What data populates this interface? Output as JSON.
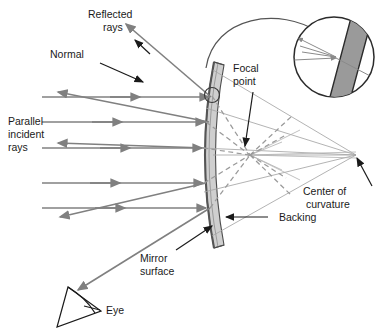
{
  "figure": {
    "background_color": "#ffffff",
    "width": 388,
    "height": 333
  },
  "colors": {
    "ray_gray": "#808080",
    "thin_gray": "#9a9a9a",
    "dashed_gray": "#9a9a9a",
    "mirror_outline": "#4d4d4d",
    "backing_fill": "#c8c8c8",
    "leader_black": "#1a1a1a",
    "text": "#1a1a1a",
    "magnifier_bar": "#8c8c8c"
  },
  "labels": {
    "reflected_rays": {
      "line1": "Reflected",
      "line2": "rays"
    },
    "normal": {
      "line1": "Normal"
    },
    "parallel_incident_rays": {
      "line1": "Parallel",
      "line2": "incident",
      "line3": "rays"
    },
    "focal_point": {
      "line1": "Focal",
      "line2": "point"
    },
    "center_of_curvature": {
      "line1": "Center of",
      "line2": "curvature"
    },
    "backing": {
      "line1": "Backing"
    },
    "mirror_surface": {
      "line1": "Mirror",
      "line2": "surface"
    },
    "eye": {
      "line1": "Eye"
    }
  },
  "optics_data": {
    "type": "ray-diagram",
    "element": "concave spherical mirror",
    "focal_point": {
      "x": 250,
      "y": 155
    },
    "center_of_curvature": {
      "x": 356,
      "y": 155
    },
    "mirror_vertex": {
      "x": 213,
      "y": 155
    },
    "incidence_marker": {
      "x": 212,
      "y": 95,
      "kind": "reflection-point-circle"
    },
    "incident_rays": [
      {
        "y": 97,
        "x_start": 42,
        "x_end": 211
      },
      {
        "y": 122,
        "x_start": 42,
        "x_end": 207
      },
      {
        "y": 148,
        "x_start": 42,
        "x_end": 205
      },
      {
        "y": 183,
        "x_start": 42,
        "x_end": 206
      },
      {
        "y": 208,
        "x_start": 42,
        "x_end": 209
      }
    ],
    "reflected_rays_count": 5,
    "converge_to": "focal_point",
    "normal_lines": "radii from mirror surface to center of curvature",
    "magnifier": {
      "cx": 334,
      "cy": 57,
      "r": 40,
      "shows": "enlarged mirror cross-section with incident and reflected rays"
    },
    "observer": {
      "name": "eye",
      "x": 78,
      "y": 305
    }
  }
}
